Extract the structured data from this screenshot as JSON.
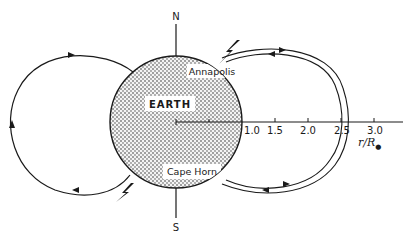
{
  "diagram": {
    "earth": {
      "label": "EARTH",
      "center": [
        176,
        122
      ],
      "radius_px": 66,
      "fill_pattern": "stipple"
    },
    "poles": {
      "north": "N",
      "south": "S"
    },
    "locations": {
      "north_site": "Annapolis",
      "south_site": "Cape Horn"
    },
    "axis": {
      "label_r": "r/R",
      "label_sub": "e",
      "ticks": [
        "1.0",
        "1.5",
        "2.0",
        "2.5",
        "3.0"
      ]
    },
    "field_lines": [
      {
        "name": "left-loop",
        "side": "west",
        "direction": "clockwise"
      },
      {
        "name": "right-inner-loop",
        "side": "east",
        "apex_r": "2.5"
      },
      {
        "name": "right-outer-loop",
        "side": "east",
        "apex_r": "2.55"
      }
    ],
    "lightning_markers": [
      {
        "name": "lightning-north",
        "near": "Annapolis"
      },
      {
        "name": "lightning-south",
        "near": "southwest footpoint"
      }
    ],
    "colors": {
      "ink": "#1a1a1a",
      "background": "#ffffff"
    }
  }
}
